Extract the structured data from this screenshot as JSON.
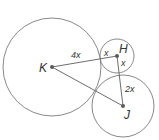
{
  "diagram": {
    "points": {
      "K": {
        "label": "K",
        "x": 52,
        "y": 67
      },
      "H": {
        "label": "H",
        "x": 117,
        "y": 56
      },
      "J": {
        "label": "J",
        "x": 123,
        "y": 106
      }
    },
    "circles": [
      {
        "center": "K",
        "r": 49
      },
      {
        "center": "H",
        "r": 17
      },
      {
        "center": "J",
        "r": 31
      }
    ],
    "segments": [
      {
        "from": "K",
        "to": "H"
      },
      {
        "from": "H",
        "to": "J"
      },
      {
        "from": "K",
        "to": "J"
      }
    ],
    "labels": {
      "kh_k_part": "4x",
      "kh_h_part": "x",
      "hj_h_part": "x",
      "hj_j_part": "2x"
    }
  }
}
